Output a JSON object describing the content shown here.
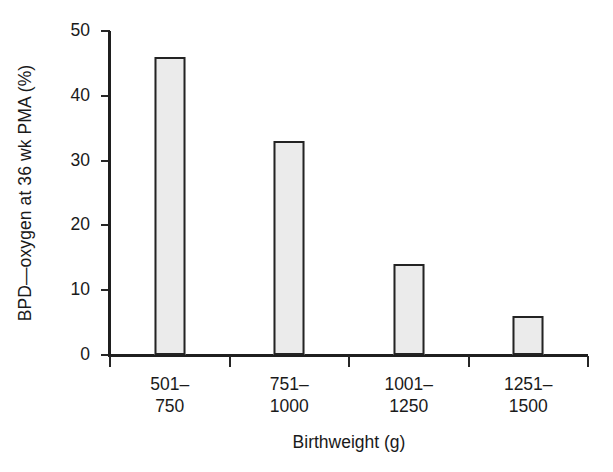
{
  "figure": {
    "background_color": "#ffffff",
    "bar_fill_color": "#ebebeb",
    "bar_edge_color": "#232323",
    "axis_color": "#1f1f1f",
    "text_color": "#1a1a1a"
  },
  "chart_data": {
    "type": "bar",
    "title": "",
    "subtitle": "",
    "xlabel": "Birthweight (g)",
    "ylabel": "BPD—oxygen at 36 wk PMA (%)",
    "categories": [
      "501–750",
      "751–1000",
      "1001–1250",
      "1251–1500"
    ],
    "category_lines": [
      [
        "501–",
        "750"
      ],
      [
        "751–",
        "1000"
      ],
      [
        "1001–",
        "1250"
      ],
      [
        "1251–",
        "1500"
      ]
    ],
    "values": [
      46,
      33,
      14,
      6
    ],
    "ylim": [
      0,
      50
    ],
    "yticks": [
      0,
      10,
      20,
      30,
      40,
      50
    ],
    "ytick_labels": [
      "0",
      "10",
      "20",
      "30",
      "40",
      "50"
    ],
    "grid": false,
    "legend": null,
    "legend_position": "none",
    "annotations": []
  }
}
